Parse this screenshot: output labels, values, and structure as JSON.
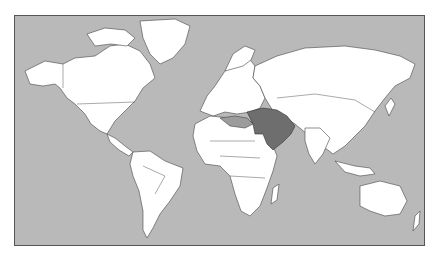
{
  "map": {
    "type": "world political map (Mercator)",
    "colors": {
      "ocean": "#b9b9b9",
      "land": "#ffffff",
      "highlight_primary": "#6e6e6e",
      "highlight_secondary": "#9c9c9c",
      "border": "#444444"
    },
    "highlighted_regions": [
      {
        "name": "Middle East core (Turkey, Iran, Iraq, Syria, Saudi Arabia, Egypt, Gulf states)",
        "shade": "primary"
      },
      {
        "name": "North Africa / Mediterranean fringe",
        "shade": "secondary"
      }
    ],
    "labels": []
  }
}
